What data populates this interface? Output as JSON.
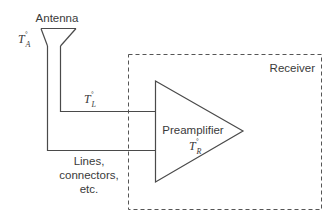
{
  "diagram": {
    "antenna": {
      "label": "Antenna",
      "temp_symbol": "T",
      "temp_subscript": "A",
      "temp_superscript": "°"
    },
    "line": {
      "temp_symbol": "T",
      "temp_subscript": "L",
      "temp_superscript": "°",
      "label_lines": [
        "Lines,",
        "connectors,",
        "etc."
      ]
    },
    "preamplifier": {
      "label": "Preamplifier",
      "temp_symbol": "T",
      "temp_subscript": "R",
      "temp_superscript": "°"
    },
    "receiver": {
      "label": "Receiver"
    },
    "colors": {
      "stroke": "#4a4a4a",
      "text": "#3a3a3a",
      "background": "#ffffff"
    }
  }
}
